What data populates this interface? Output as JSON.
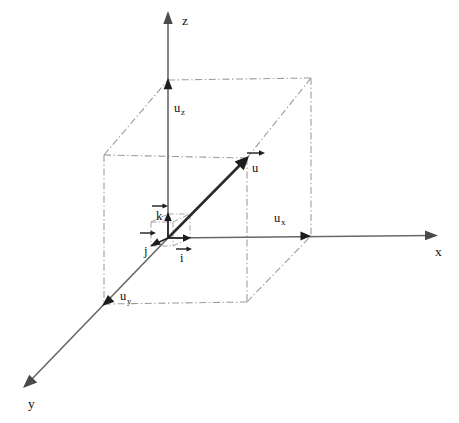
{
  "figure": {
    "background_color": "#ffffff",
    "width": 459,
    "height": 423
  },
  "axes": [
    {
      "key": "x",
      "label": "x",
      "label_pos": [
        438,
        254
      ],
      "from": [
        168,
        238
      ],
      "to": [
        437,
        235
      ],
      "color": "#676767"
    },
    {
      "key": "y",
      "label": "y",
      "label_pos": [
        31,
        407
      ],
      "from": [
        168,
        238
      ],
      "to": [
        26,
        385
      ],
      "color": "#676767"
    },
    {
      "key": "z",
      "label": "z",
      "label_pos": [
        182,
        23
      ],
      "from": [
        168,
        238
      ],
      "to": [
        168,
        13
      ],
      "color": "#676767"
    }
  ],
  "vector": {
    "name": "u",
    "label_base": "u",
    "label_pos": [
      253,
      170
    ],
    "overbar_from": [
      247,
      153
    ],
    "overbar_to": [
      264,
      153
    ],
    "from": [
      168,
      238
    ],
    "to": [
      247,
      158
    ],
    "color": "#2b2b2b"
  },
  "components": [
    {
      "key": "ux",
      "label_base": "u",
      "label_sub": "x",
      "label_pos": [
        276,
        221
      ],
      "tip": [
        310,
        236
      ],
      "axis": "x"
    },
    {
      "key": "uy",
      "label_base": "u",
      "label_sub": "y",
      "label_pos": [
        121,
        299
      ],
      "tip": [
        104,
        304
      ],
      "axis": "y"
    },
    {
      "key": "uz",
      "label_base": "u",
      "label_sub": "z",
      "label_pos": [
        174,
        110
      ],
      "tip": [
        168,
        80
      ],
      "axis": "z"
    }
  ],
  "unit_vectors": [
    {
      "key": "i",
      "label": "i",
      "label_pos": [
        181,
        256
      ],
      "overbar_from": [
        176,
        239
      ],
      "overbar_to": [
        191,
        239
      ],
      "from": [
        168,
        238
      ],
      "to": [
        190,
        238
      ],
      "direction": "x"
    },
    {
      "key": "j",
      "label": "j",
      "label_pos": [
        146,
        252
      ],
      "overbar_from": [
        142,
        233
      ],
      "overbar_to": [
        157,
        233
      ],
      "from": [
        168,
        238
      ],
      "to": [
        151,
        246
      ],
      "direction": "y"
    },
    {
      "key": "k",
      "label": "k",
      "label_pos": [
        157,
        224
      ],
      "overbar_from": [
        157,
        207
      ],
      "overbar_to": [
        172,
        207
      ],
      "from": [
        168,
        238
      ],
      "to": [
        168,
        214
      ],
      "direction": "z"
    }
  ],
  "guide_boxes": [
    {
      "key": "large-projection-box",
      "style": "dash-dot",
      "color": "#9a9a9a",
      "corners": {
        "front_bottom_left": [
          104,
          304
        ],
        "front_bottom_right": [
          247,
          302
        ],
        "front_top_left": [
          104,
          155
        ],
        "front_top_right": [
          247,
          158
        ],
        "back_bottom_left": [
          168,
          238
        ],
        "back_bottom_right": [
          311,
          236
        ],
        "back_top_left": [
          168,
          80
        ],
        "back_top_right": [
          311,
          78
        ]
      }
    },
    {
      "key": "unit-cube",
      "style": "dash-dot",
      "color": "#a4a4a4",
      "corners": {
        "front_bottom_left": [
          151,
          246
        ],
        "front_bottom_right": [
          173,
          246
        ],
        "front_top_left": [
          151,
          222
        ],
        "front_top_right": [
          173,
          222
        ],
        "back_bottom_left": [
          168,
          238
        ],
        "back_bottom_right": [
          190,
          238
        ],
        "back_top_left": [
          168,
          214
        ],
        "back_top_right": [
          190,
          214
        ]
      }
    }
  ]
}
